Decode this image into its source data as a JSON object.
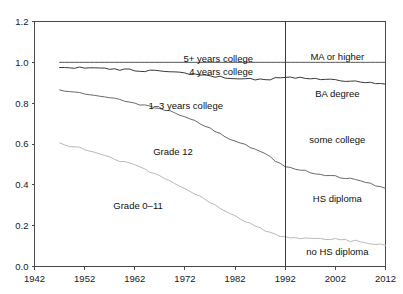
{
  "chart_data": {
    "type": "line",
    "title": "",
    "subtitle": "",
    "xlabel": "",
    "ylabel": "",
    "xlim": [
      1942,
      2012
    ],
    "ylim": [
      0.0,
      1.2
    ],
    "grid": false,
    "legend_position": "inline-annotations",
    "x_ticks": [
      "1942",
      "1952",
      "1962",
      "1972",
      "1982",
      "1992",
      "2002",
      "2012"
    ],
    "x_tick_values": [
      1942,
      1952,
      1962,
      1972,
      1982,
      1992,
      2002,
      2012
    ],
    "y_ticks": [
      "0.0",
      "0.2",
      "0.4",
      "0.6",
      "0.8",
      "1.0",
      "1.2"
    ],
    "y_tick_values": [
      0.0,
      0.2,
      0.4,
      0.6,
      0.8,
      1.0,
      1.2
    ],
    "annotations": [
      {
        "text": "5+ years college",
        "x": 1980,
        "y": 1.02
      },
      {
        "text": "4 years college",
        "x": 1980,
        "y": 0.955
      },
      {
        "text": "1–3 years college",
        "x": 1974,
        "y": 0.79
      },
      {
        "text": "Grade 12",
        "x": 1968,
        "y": 0.565
      },
      {
        "text": "Grade 0–11",
        "x": 1962,
        "y": 0.3
      },
      {
        "text": "MA or higher",
        "x": 2002,
        "y": 1.03
      },
      {
        "text": "BA degree",
        "x": 2002,
        "y": 0.845
      },
      {
        "text": "some college",
        "x": 2002,
        "y": 0.62
      },
      {
        "text": "HS diploma",
        "x": 2002,
        "y": 0.335
      },
      {
        "text": "no HS diploma",
        "x": 2002,
        "y": 0.075
      }
    ],
    "divider": {
      "x": 1992,
      "label": "1992 survey redefinition"
    },
    "series": [
      {
        "name": "5+ years college",
        "right_panel_name": "MA or higher",
        "color": "#555555",
        "x": [
          1947,
          1952,
          1957,
          1962,
          1967,
          1972,
          1977,
          1982,
          1987,
          1992,
          1997,
          2002,
          2007,
          2012
        ],
        "values": [
          1.0,
          1.0,
          1.0,
          1.0,
          1.0,
          1.0,
          1.0,
          1.0,
          1.0,
          1.0,
          1.0,
          1.0,
          1.0,
          1.0
        ]
      },
      {
        "name": "4 years college",
        "right_panel_name": "BA degree",
        "color": "#3a3a3a",
        "x": [
          1947,
          1952,
          1957,
          1962,
          1967,
          1972,
          1977,
          1982,
          1987,
          1992,
          1997,
          2002,
          2007,
          2012
        ],
        "values": [
          0.975,
          0.972,
          0.968,
          0.962,
          0.955,
          0.945,
          0.932,
          0.922,
          0.915,
          0.925,
          0.921,
          0.915,
          0.905,
          0.893
        ]
      },
      {
        "name": "1–3 years college",
        "right_panel_name": "some college",
        "color": "#6a6a6a",
        "x": [
          1947,
          1952,
          1957,
          1962,
          1967,
          1972,
          1977,
          1982,
          1987,
          1992,
          1997,
          2002,
          2007,
          2012
        ],
        "values": [
          0.86,
          0.845,
          0.825,
          0.8,
          0.775,
          0.735,
          0.675,
          0.615,
          0.565,
          0.49,
          0.462,
          0.442,
          0.418,
          0.382
        ]
      },
      {
        "name": "Grade 12",
        "right_panel_name": "HS diploma",
        "color": "#b9b9b9",
        "x": [
          1947,
          1952,
          1957,
          1962,
          1967,
          1972,
          1977,
          1982,
          1987,
          1992,
          1997,
          2002,
          2007,
          2012
        ],
        "values": [
          0.602,
          0.575,
          0.532,
          0.495,
          0.445,
          0.385,
          0.315,
          0.245,
          0.185,
          0.142,
          0.135,
          0.132,
          0.122,
          0.103
        ]
      }
    ]
  }
}
